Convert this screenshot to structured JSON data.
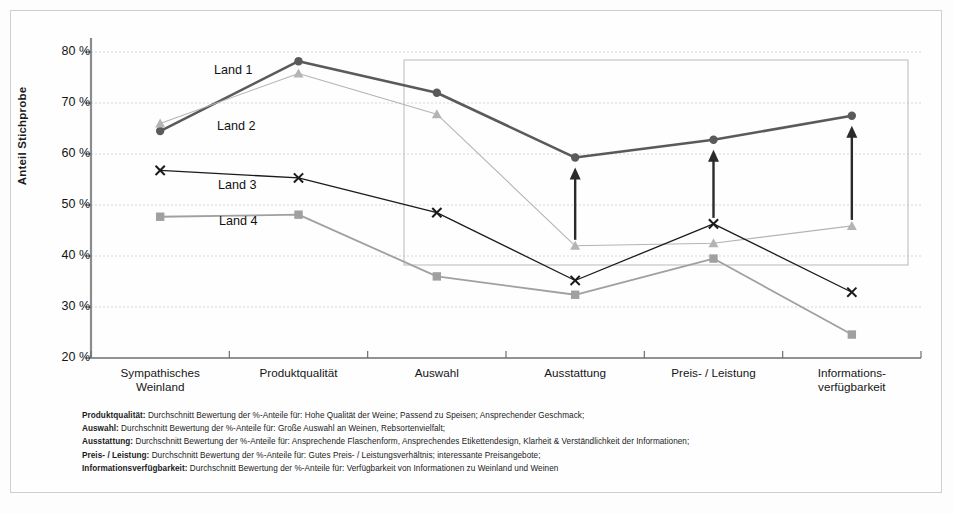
{
  "chart_data": {
    "type": "line",
    "title": "",
    "xlabel": "",
    "ylabel": "Anteil Stichprobe",
    "ylim": [
      20,
      80
    ],
    "ytick_labels": [
      "80 %",
      "70 %",
      "60 %",
      "50 %",
      "40 %",
      "30 %",
      "20 %"
    ],
    "ytick_values": [
      80,
      70,
      60,
      50,
      40,
      30,
      20
    ],
    "grid": true,
    "legend_position": "inline-annotations",
    "categories": [
      "Sympathisches Weinland",
      "Produktqualität",
      "Auswahl",
      "Ausstattung",
      "Preis- / Leistung",
      "Informations-verfügbarkeit"
    ],
    "category_lines": [
      [
        "Sympathisches",
        "Weinland"
      ],
      [
        "Produktqualität"
      ],
      [
        "Auswahl"
      ],
      [
        "Ausstattung"
      ],
      [
        "Preis- / Leistung"
      ],
      [
        "Informations-",
        "verfügbarkeit"
      ]
    ],
    "series": [
      {
        "name": "Land 1",
        "marker": "circle",
        "color": "#5a5a5a",
        "width": 2.6,
        "values": [
          64.5,
          78.2,
          72.0,
          59.3,
          62.8,
          67.5
        ]
      },
      {
        "name": "Land 2",
        "marker": "triangle",
        "color": "#b4b4b4",
        "width": 1.1,
        "values": [
          66.0,
          75.8,
          67.8,
          42.0,
          42.5,
          45.9
        ]
      },
      {
        "name": "Land 3",
        "marker": "x",
        "color": "#1a1a1a",
        "width": 1.3,
        "values": [
          56.8,
          55.3,
          48.5,
          35.2,
          46.3,
          32.9
        ]
      },
      {
        "name": "Land 4",
        "marker": "square",
        "color": "#a0a0a0",
        "width": 1.8,
        "values": [
          47.7,
          48.1,
          36.0,
          32.4,
          39.5,
          24.6
        ]
      }
    ],
    "series_label_annotations": [
      {
        "text": "Land 1",
        "x_px": 214,
        "y_px": 71
      },
      {
        "text": "Land 2",
        "x_px": 217,
        "y_px": 127
      },
      {
        "text": "Land 3",
        "x_px": 218,
        "y_px": 186
      },
      {
        "text": "Land 4",
        "x_px": 219,
        "y_px": 222
      }
    ],
    "highlight_box": {
      "x1_px": 404,
      "y1_px": 60,
      "x2_px": 908,
      "y2_px": 265,
      "color": "#b9b9b9"
    },
    "arrow_annotations": [
      {
        "category": "Ausstattung",
        "from": 42.0,
        "to": 59.3,
        "color": "#2a2a2a"
      },
      {
        "category": "Preis- / Leistung",
        "from": 46.3,
        "to": 62.8,
        "color": "#2a2a2a"
      },
      {
        "category": "Informations-verfügbarkeit",
        "from": 45.9,
        "to": 67.5,
        "color": "#2a2a2a"
      }
    ]
  },
  "notes": [
    {
      "term": "Produktqualität:",
      "text": " Durchschnitt Bewertung der %-Anteile für: Hohe Qualität der Weine; Passend zu Speisen; Ansprechender Geschmack;"
    },
    {
      "term": "Auswahl:",
      "text": " Durchschnitt Bewertung der %-Anteile für: Große Auswahl an Weinen, Rebsortenvielfalt;"
    },
    {
      "term": "Ausstattung:",
      "text": " Durchschnitt Bewertung der %-Anteile für: Ansprechende Flaschenform, Ansprechendes Etikettendesign, Klarheit & Verständlichkeit der Informationen;"
    },
    {
      "term": "Preis- / Leistung:",
      "text": " Durchschnitt Bewertung der %-Anteile für: Gutes Preis- / Leistungsverhältnis; interessante Preisangebote;"
    },
    {
      "term": "Informationsverfügbarkeit:",
      "text": " Durchschnitt Bewertung der %-Anteile für: Verfügbarkeit von Informationen zu Weinland und Weinen"
    }
  ]
}
